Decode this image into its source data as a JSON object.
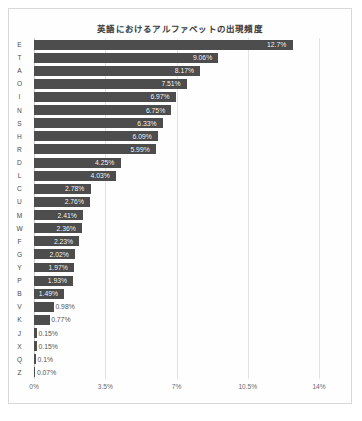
{
  "chart_data": {
    "type": "bar",
    "orientation": "horizontal",
    "title": "英語におけるアルファベットの出現頻度",
    "xlabel": "",
    "ylabel": "",
    "xlim": [
      0,
      14
    ],
    "xticks": [
      "0%",
      "3.5%",
      "7%",
      "10.5%",
      "14%"
    ],
    "xtick_values": [
      0,
      3.5,
      7,
      10.5,
      14
    ],
    "grid": true,
    "legend": "none",
    "bar_color": "#4d4d4d",
    "categories": [
      "E",
      "T",
      "A",
      "O",
      "I",
      "N",
      "S",
      "H",
      "R",
      "D",
      "L",
      "C",
      "U",
      "M",
      "W",
      "F",
      "G",
      "Y",
      "P",
      "B",
      "V",
      "K",
      "J",
      "X",
      "Q",
      "Z"
    ],
    "values": [
      12.7,
      9.06,
      8.17,
      7.51,
      6.97,
      6.75,
      6.33,
      6.09,
      5.99,
      4.25,
      4.03,
      2.78,
      2.76,
      2.41,
      2.36,
      2.23,
      2.02,
      1.97,
      1.93,
      1.49,
      0.98,
      0.77,
      0.15,
      0.15,
      0.1,
      0.07
    ],
    "data_labels": [
      "12.7%",
      "9.06%",
      "8.17%",
      "7.51%",
      "6.97%",
      "6.75%",
      "6.33%",
      "6.09%",
      "5.99%",
      "4.25%",
      "4.03%",
      "2.78%",
      "2.76%",
      "2.41%",
      "2.36%",
      "2.23%",
      "2.02%",
      "1.97%",
      "1.93%",
      "1.49%",
      "0.98%",
      "0.77%",
      "0.15%",
      "0.15%",
      "0.1%",
      "0.07%"
    ]
  }
}
